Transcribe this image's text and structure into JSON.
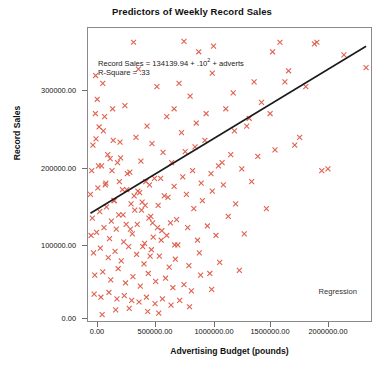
{
  "chart_data": {
    "type": "scatter",
    "title": "Predictors of Weekly Record Sales",
    "xlabel": "Advertising Budget (pounds)",
    "ylabel": "Record Sales",
    "xlim": [
      0,
      2300000
    ],
    "ylim": [
      0,
      370000
    ],
    "grid": false,
    "legend_position": "bottom-right",
    "legend_entries": [
      "Regression"
    ],
    "marker": {
      "symbol": "x",
      "color": "#e0614f",
      "size": 5
    },
    "annotations": [
      {
        "text_prefix": "Record Sales = 134139.94 + .10",
        "superscript": "2",
        "text_suffix": " + adverts",
        "x": 0.04,
        "y": 0.91
      },
      {
        "text": "R-Square = .33",
        "x": 0.04,
        "y": 0.87
      }
    ],
    "regression_line": {
      "intercept": 134139.94,
      "slope": 0.1,
      "r_square": 0.33,
      "label": "Regression",
      "color": "#1a1a1a",
      "x_start": 20000,
      "y_start": 136000,
      "x_end": 2260000,
      "y_end": 347000
    },
    "xticks": [
      0,
      500000,
      1000000,
      1500000,
      2000000
    ],
    "xtick_labels": [
      "0.00",
      "500000.00",
      "1000000.00",
      "1500000.00",
      "2000000.00"
    ],
    "yticks": [
      0,
      100000,
      200000,
      300000
    ],
    "ytick_labels": [
      "0.00",
      "100000.00",
      "200000.00",
      "300000.00"
    ],
    "x": [
      62000,
      370000,
      780000,
      900000,
      1020000,
      1560000,
      120000,
      410000,
      560000,
      1010000,
      60000,
      200000,
      640000,
      740000,
      1500000,
      1840000,
      90000,
      300000,
      480000,
      700000,
      830000,
      1180000,
      1350000,
      1630000,
      2080000,
      40000,
      160000,
      260000,
      390000,
      520000,
      610000,
      760000,
      880000,
      960000,
      1120000,
      1290000,
      1410000,
      1720000,
      30000,
      110000,
      180000,
      240000,
      320000,
      430000,
      500000,
      590000,
      680000,
      790000,
      870000,
      950000,
      1060000,
      1190000,
      1310000,
      1480000,
      1600000,
      1900000,
      20000,
      80000,
      140000,
      210000,
      280000,
      350000,
      420000,
      470000,
      540000,
      620000,
      700000,
      770000,
      850000,
      920000,
      1000000,
      1090000,
      1160000,
      1250000,
      1380000,
      1520000,
      1680000,
      35000,
      95000,
      150000,
      190000,
      250000,
      310000,
      380000,
      440000,
      510000,
      570000,
      650000,
      720000,
      800000,
      860000,
      930000,
      1010000,
      1100000,
      1200000,
      1330000,
      1450000,
      25000,
      70000,
      130000,
      175000,
      230000,
      290000,
      360000,
      400000,
      460000,
      530000,
      600000,
      670000,
      730000,
      810000,
      890000,
      970000,
      1040000,
      1140000,
      1270000,
      45000,
      100000,
      165000,
      220000,
      270000,
      330000,
      395000,
      455000,
      515000,
      580000,
      660000,
      710000,
      820000,
      905000,
      990000,
      1070000,
      1230000,
      55000,
      120000,
      185000,
      245000,
      305000,
      365000,
      425000,
      490000,
      550000,
      630000,
      690000,
      780000,
      840000,
      915000,
      1005000,
      50000,
      105000,
      170000,
      235000,
      295000,
      355000,
      415000,
      475000,
      545000,
      605000,
      675000,
      745000,
      825000,
      65000,
      125000,
      195000,
      255000,
      315000,
      375000,
      435000,
      495000,
      565000,
      640000,
      705000,
      75000,
      135000,
      205000,
      265000,
      340000,
      405000,
      465000,
      525000,
      595000,
      85000,
      145000,
      215000,
      285000,
      345000,
      445000,
      505000,
      115000,
      225000,
      335000,
      485000,
      575000,
      1950000,
      2260000,
      1770000,
      1860000
    ],
    "y": [
      310000,
      352000,
      353000,
      340000,
      347000,
      352000,
      300000,
      318000,
      296000,
      313000,
      262000,
      268000,
      258000,
      300000,
      340000,
      350000,
      245000,
      272000,
      246000,
      268000,
      284000,
      288000,
      302000,
      316000,
      336000,
      222000,
      210000,
      226000,
      232000,
      224000,
      213000,
      238000,
      250000,
      262000,
      268000,
      246000,
      276000,
      232000,
      190000,
      196000,
      205000,
      200000,
      186000,
      202000,
      172000,
      180000,
      200000,
      214000,
      220000,
      228000,
      196000,
      240000,
      256000,
      262000,
      302000,
      190000,
      160000,
      168000,
      172000,
      152000,
      166000,
      148000,
      162000,
      176000,
      180000,
      158000,
      170000,
      182000,
      190000,
      174000,
      186000,
      200000,
      210000,
      192000,
      208000,
      216000,
      222000,
      130000,
      138000,
      144000,
      126000,
      134000,
      122000,
      140000,
      150000,
      132000,
      146000,
      156000,
      128000,
      160000,
      142000,
      152000,
      164000,
      172000,
      148000,
      176000,
      142000,
      108000,
      112000,
      118000,
      104000,
      116000,
      100000,
      110000,
      122000,
      98000,
      106000,
      114000,
      124000,
      96000,
      118000,
      102000,
      120000,
      108000,
      132000,
      110000,
      86000,
      92000,
      80000,
      88000,
      76000,
      94000,
      84000,
      72000,
      90000,
      82000,
      68000,
      78000,
      70000,
      86000,
      60000,
      74000,
      64000,
      58000,
      62000,
      52000,
      66000,
      48000,
      56000,
      44000,
      60000,
      50000,
      54000,
      42000,
      46000,
      38000,
      58000,
      40000,
      34000,
      30000,
      36000,
      28000,
      32000,
      26000,
      24000,
      30000,
      22000,
      28000,
      20000,
      26000,
      18000,
      230000,
      240000,
      190000,
      176000,
      166000,
      158000,
      140000,
      130000,
      118000,
      108000,
      96000,
      280000,
      258000,
      228000,
      206000,
      188000,
      164000,
      146000,
      124000,
      102000,
      196000,
      174000,
      152000,
      134000,
      116000,
      94000,
      82000,
      8000,
      14000,
      16000,
      12000,
      10000,
      192000,
      320000,
      296000,
      352000
    ]
  }
}
